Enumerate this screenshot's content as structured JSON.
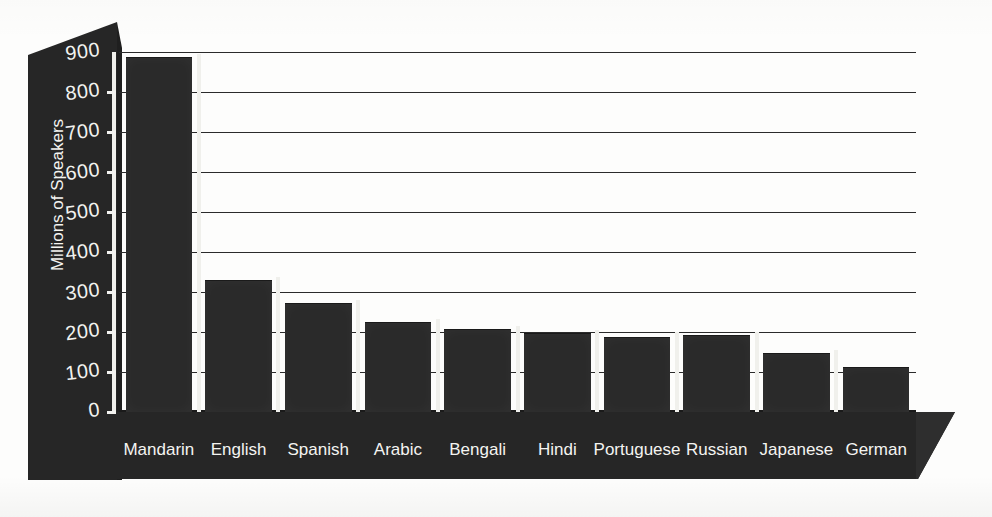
{
  "chart_data": {
    "type": "bar",
    "title": "",
    "xlabel": "",
    "ylabel": "Millions of Speakers",
    "categories": [
      "Mandarin",
      "English",
      "Spanish",
      "Arabic",
      "Bengali",
      "Hindi",
      "Portuguese",
      "Russian",
      "Japanese",
      "German"
    ],
    "values": [
      885,
      327,
      270,
      222,
      204,
      196,
      186,
      189,
      144,
      111
    ],
    "ylim": [
      0,
      900
    ],
    "ytick_labels": [
      "900",
      "800",
      "700",
      "600",
      "500",
      "400",
      "300",
      "200",
      "100",
      "0"
    ],
    "ytick_values": [
      900,
      800,
      700,
      600,
      500,
      400,
      300,
      200,
      100,
      0
    ],
    "grid": true,
    "legend": false,
    "orientation": "vertical",
    "series": [
      {
        "name": "Millions of Speakers",
        "values": [
          885,
          327,
          270,
          222,
          204,
          196,
          186,
          189,
          144,
          111
        ]
      }
    ]
  },
  "style": {
    "bar_color": "#2a2a2a",
    "panel_color": "#262626",
    "plot_background": "#ffffff",
    "tick_text_color": "#f2f2ef",
    "gridline_color": "#2b2b2b"
  }
}
